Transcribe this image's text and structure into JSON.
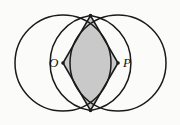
{
  "figure": {
    "background_color": "#fbfbfa",
    "stroke_color": "#1a1a1a",
    "shade_color": "#c9c9c9",
    "labels": {
      "left_center": "O",
      "right_center": "P"
    },
    "geometry": {
      "circles": [
        {
          "name": "left-circle",
          "cx": 63,
          "cy": 63,
          "r": 48
        },
        {
          "name": "right-circle",
          "cx": 118,
          "cy": 63,
          "r": 48
        }
      ],
      "intersection_points": [
        {
          "name": "top-intersection",
          "x": 90.5,
          "y": 15.6
        },
        {
          "name": "bottom-intersection",
          "x": 90.5,
          "y": 110.4
        }
      ],
      "rhombus_vertices": [
        {
          "name": "top-vertex",
          "x": 90.5,
          "y": 15.6
        },
        {
          "name": "left-vertex-O",
          "x": 63,
          "y": 63
        },
        {
          "name": "bottom-vertex",
          "x": 90.5,
          "y": 110.4
        },
        {
          "name": "right-vertex-P",
          "x": 118,
          "y": 63
        }
      ],
      "lens_arcs": [
        {
          "name": "lens-arc-left",
          "from": "top-intersection",
          "to": "bottom-intersection",
          "bulges_toward": "left"
        },
        {
          "name": "lens-arc-right",
          "from": "top-intersection",
          "to": "bottom-intersection",
          "bulges_toward": "right"
        }
      ]
    }
  }
}
